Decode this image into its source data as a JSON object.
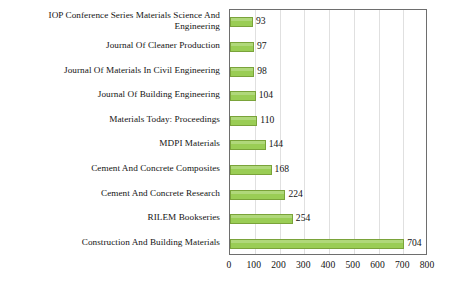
{
  "chart_data": {
    "type": "bar",
    "orientation": "horizontal",
    "title": "",
    "xlabel": "",
    "ylabel": "",
    "xlim": [
      0,
      800
    ],
    "xticks": [
      0,
      100,
      200,
      300,
      400,
      500,
      600,
      700,
      800
    ],
    "grid": true,
    "legend": null,
    "categories": [
      "IOP Conference Series Materials Science And Engineering",
      "Journal Of Cleaner Production",
      "Journal Of Materials In Civil Engineering",
      "Journal Of Building Engineering",
      "Materials Today: Proceedings",
      "MDPI Materials",
      "Cement And Concrete Composites",
      "Cement And Concrete Research",
      "RILEM Bookseries",
      "Construction And Building Materials"
    ],
    "values": [
      93,
      97,
      98,
      104,
      110,
      144,
      168,
      224,
      254,
      704
    ],
    "data_labels": [
      "93",
      "97",
      "98",
      "104",
      "110",
      "144",
      "168",
      "224",
      "254",
      "704"
    ],
    "colors": {
      "bar_fill": "#9ACD55",
      "bar_border": "#7aa33a",
      "gridline": "#e0e0e0",
      "frame": "#6e6e6e",
      "text": "#141414",
      "background": "#ffffff"
    }
  }
}
